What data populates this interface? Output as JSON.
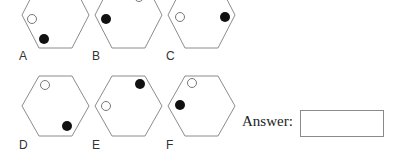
{
  "puzzle": {
    "options": [
      {
        "label": "A",
        "white_dot": "upper-left",
        "black_dot": "lower-left"
      },
      {
        "label": "B",
        "white_dot": "top",
        "black_dot": "upper-left"
      },
      {
        "label": "C",
        "white_dot": "left",
        "black_dot": "right"
      },
      {
        "label": "D",
        "white_dot": "top-left",
        "black_dot": "lower-right"
      },
      {
        "label": "E",
        "white_dot": "left",
        "black_dot": "top-right"
      },
      {
        "label": "F",
        "white_dot": "top-left",
        "black_dot": "left"
      }
    ],
    "answer_label": "Answer:",
    "answer_value": ""
  },
  "colors": {
    "outline": "#8c8c8c",
    "black_dot": "#111111",
    "white_dot_stroke": "#777777"
  }
}
